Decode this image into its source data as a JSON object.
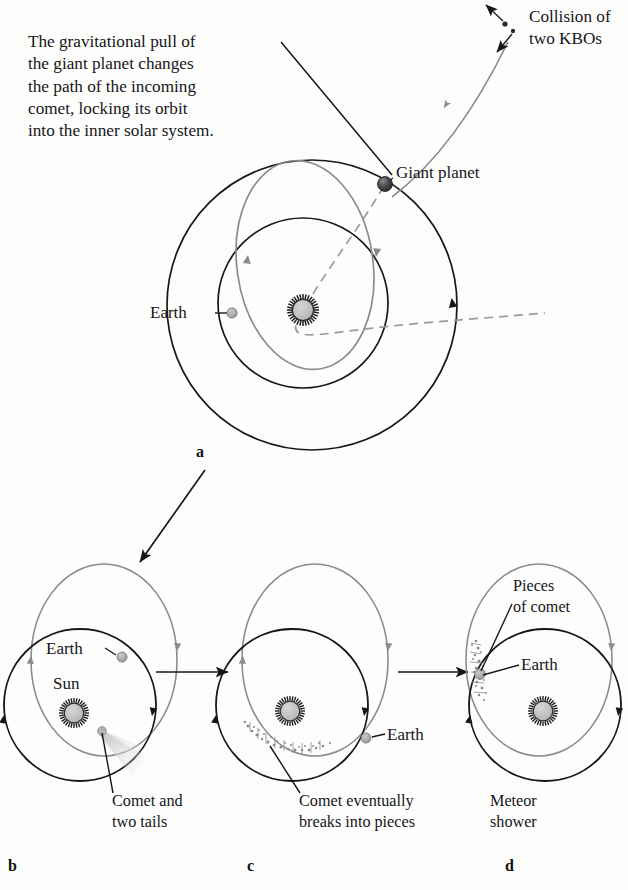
{
  "figure": {
    "title_note": "Origin of a meteor shower from a captured comet",
    "background_color": "#fdfdfc",
    "ink_color": "#16161a",
    "orbit_black": "#17171a",
    "orbit_gray": "#8c8c90",
    "sun_fill": "#bdbdbd",
    "earth_fill": "#a8a8ac",
    "planet_fill": "#3a3a3e",
    "tail_fill": "#d8d8da"
  },
  "annotations": {
    "gravitational_pull": "The gravitational pull of\nthe giant planet changes\nthe path of the incoming\ncomet, locking its orbit\ninto the inner solar system.",
    "collision": "Collision of\ntwo KBOs",
    "giant_planet": "Giant planet",
    "earth_a": "Earth"
  },
  "panels": [
    {
      "id": "a",
      "letter": "a",
      "labels": {
        "earth": "Earth",
        "giant_planet": "Giant planet"
      },
      "elements": [
        "giant-planet-orbit",
        "earth-orbit",
        "comet-captured-orbit",
        "incoming-comet-path",
        "sun",
        "earth",
        "giant-planet"
      ]
    },
    {
      "id": "b",
      "letter": "b",
      "labels": {
        "earth": "Earth",
        "sun": "Sun",
        "caption": "Comet and\ntwo tails"
      },
      "elements": [
        "earth-orbit",
        "comet-orbit",
        "sun",
        "earth",
        "comet-with-tails"
      ]
    },
    {
      "id": "c",
      "letter": "c",
      "labels": {
        "earth": "Earth",
        "caption": "Comet eventually\nbreaks into pieces"
      },
      "elements": [
        "earth-orbit",
        "comet-orbit",
        "sun",
        "earth",
        "comet-debris-stream"
      ]
    },
    {
      "id": "d",
      "letter": "d",
      "labels": {
        "earth": "Earth",
        "pieces": "Pieces\nof comet",
        "caption": "Meteor\nshower"
      },
      "elements": [
        "earth-orbit",
        "comet-orbit",
        "sun",
        "earth",
        "comet-pieces-cluster"
      ]
    }
  ],
  "flow_arrows": [
    {
      "name": "arrow-a-to-b",
      "from": "a",
      "to": "b",
      "direction": "diagonal-down-left"
    },
    {
      "name": "arrow-b-to-c",
      "from": "b",
      "to": "c",
      "direction": "right"
    },
    {
      "name": "arrow-c-to-d",
      "from": "c",
      "to": "d",
      "direction": "right"
    }
  ]
}
